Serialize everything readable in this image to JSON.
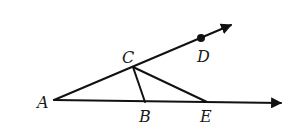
{
  "diagram": {
    "type": "geometry",
    "stroke_color": "#111111",
    "points": {
      "A": {
        "label": "A",
        "x": 54,
        "y": 100
      },
      "B": {
        "label": "B",
        "x": 145,
        "y": 102
      },
      "C": {
        "label": "C",
        "x": 133,
        "y": 67
      },
      "D": {
        "label": "D",
        "x": 201,
        "y": 38
      },
      "E": {
        "label": "E",
        "x": 207,
        "y": 102
      }
    },
    "rays": [
      {
        "name": "ray-AD",
        "from": "A",
        "through": [
          "C",
          "D"
        ]
      },
      {
        "name": "ray-AE",
        "from": "A",
        "through": [
          "B",
          "E"
        ]
      }
    ],
    "segments": [
      {
        "name": "segment-CB",
        "from": "C",
        "to": "B"
      },
      {
        "name": "segment-CE",
        "from": "C",
        "to": "E"
      }
    ],
    "marked_points": [
      "D"
    ]
  }
}
